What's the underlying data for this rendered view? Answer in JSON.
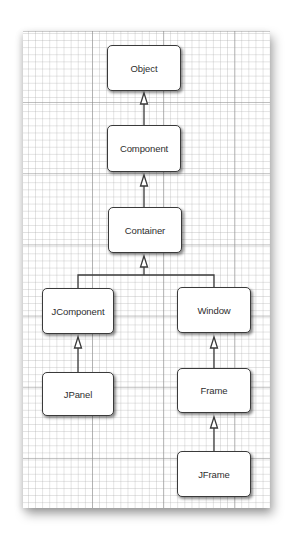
{
  "diagram": {
    "type": "class-inheritance-hierarchy",
    "colors": {
      "box_border": "#3a3a3a",
      "box_fill": "#ffffff",
      "text": "#2e2e2e",
      "line": "#3a3a3a",
      "grid_major": "#8c8c8c",
      "grid_minor": "#aaaaaa"
    },
    "nodes": {
      "object": {
        "label": "Object"
      },
      "component": {
        "label": "Component"
      },
      "container": {
        "label": "Container"
      },
      "jcomponent": {
        "label": "JComponent"
      },
      "window": {
        "label": "Window"
      },
      "jpanel": {
        "label": "JPanel"
      },
      "frame": {
        "label": "Frame"
      },
      "jframe": {
        "label": "JFrame"
      }
    },
    "edges": [
      {
        "from": "Component",
        "to": "Object",
        "kind": "inheritance"
      },
      {
        "from": "Container",
        "to": "Component",
        "kind": "inheritance"
      },
      {
        "from": "JComponent",
        "to": "Container",
        "kind": "inheritance"
      },
      {
        "from": "Window",
        "to": "Container",
        "kind": "inheritance"
      },
      {
        "from": "JPanel",
        "to": "JComponent",
        "kind": "inheritance"
      },
      {
        "from": "Frame",
        "to": "Window",
        "kind": "inheritance"
      },
      {
        "from": "JFrame",
        "to": "Frame",
        "kind": "inheritance"
      }
    ]
  }
}
